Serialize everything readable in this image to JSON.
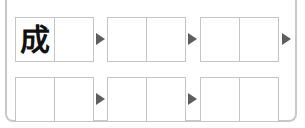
{
  "puzzle": {
    "rows": [
      {
        "boxes": [
          {
            "cells": [
              "成",
              ""
            ]
          },
          {
            "cells": [
              "",
              ""
            ]
          },
          {
            "cells": [
              "",
              ""
            ]
          }
        ],
        "arrows": 3
      },
      {
        "boxes": [
          {
            "cells": [
              "",
              ""
            ]
          },
          {
            "cells": [
              "",
              ""
            ]
          },
          {
            "cells": [
              "",
              ""
            ]
          }
        ],
        "arrows": 2
      }
    ],
    "colors": {
      "border": "#c4c4c4",
      "arrow": "#5e5e5e",
      "frame": "#c8c8c8"
    }
  }
}
